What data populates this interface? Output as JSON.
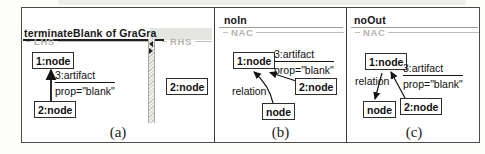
{
  "figure": {
    "caption_a": "(a)",
    "caption_b": "(b)",
    "caption_c": "(c)"
  },
  "panel_a": {
    "window_title": "terminateBlank of GraGra",
    "lhs": {
      "label": "LHS",
      "node1": "1:node",
      "node2": "2:node",
      "edge_type": "3:artifact",
      "edge_attr": "prop=\"blank\""
    },
    "rhs": {
      "label": "RHS",
      "node2": "2:node"
    }
  },
  "panel_b": {
    "title": "noIn",
    "group_label": "NAC",
    "node1": "1:node",
    "node2": "2:node",
    "node3": "node",
    "edge_type": "3:artifact",
    "edge_attr": "prop=\"blank\"",
    "relation_label": "relation"
  },
  "panel_c": {
    "title": "noOut",
    "group_label": "NAC",
    "node1": "1:node",
    "node2": "2:node",
    "node3": "node",
    "edge_type": "3:artifact",
    "edge_attr": "prop=\"blank\"",
    "relation_label": "relation"
  },
  "icons": {
    "divider_collapse_left": "left-triangle",
    "divider_collapse_right": "right-triangle"
  },
  "colors": {
    "text": "#111111",
    "muted_group_label": "#b3b2ab",
    "header_band": "#e4e4e1",
    "panel_border": "#3c3c3a",
    "divider_hatch": "#cbcac4"
  }
}
